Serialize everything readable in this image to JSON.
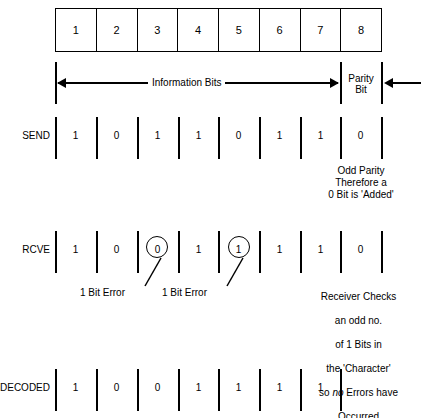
{
  "diagram": {
    "colors": {
      "ink": "#000000",
      "paper": "#ffffff"
    }
  },
  "bit_table": {
    "name": "bit-position-table",
    "positions": [
      "1",
      "2",
      "3",
      "4",
      "5",
      "6",
      "7",
      "8"
    ]
  },
  "span_row": {
    "information_bits_label": "Information Bits",
    "parity_bit_label_line1": "Parity",
    "parity_bit_label_line2": "Bit"
  },
  "rows": [
    {
      "id": "send",
      "label": "SEND",
      "bits": [
        "1",
        "0",
        "1",
        "1",
        "0",
        "1",
        "1",
        "0"
      ],
      "circled": []
    },
    {
      "id": "rcve",
      "label": "RCVE",
      "bits": [
        "1",
        "0",
        "0",
        "1",
        "1",
        "1",
        "1",
        "0"
      ],
      "circled": [
        2,
        4
      ]
    },
    {
      "id": "decoded",
      "label": "DECODED",
      "bits": [
        "1",
        "0",
        "0",
        "1",
        "1",
        "1",
        "1"
      ],
      "circled": []
    }
  ],
  "annotations": {
    "send_note": "Odd Parity\nTherefore a\n0 Bit is 'Added'",
    "error_label_1": "1 Bit Error",
    "error_label_2": "1 Bit Error",
    "rcve_note_line1": "Receiver Checks",
    "rcve_note_line2": "an odd no.",
    "rcve_note_line3": "of 1 Bits in",
    "rcve_note_line4": "the 'Character'",
    "rcve_note_line5_pre": "so ",
    "rcve_note_line5_em": "no",
    "rcve_note_line5_post": " Errors have",
    "rcve_note_line6": "Occurred"
  }
}
